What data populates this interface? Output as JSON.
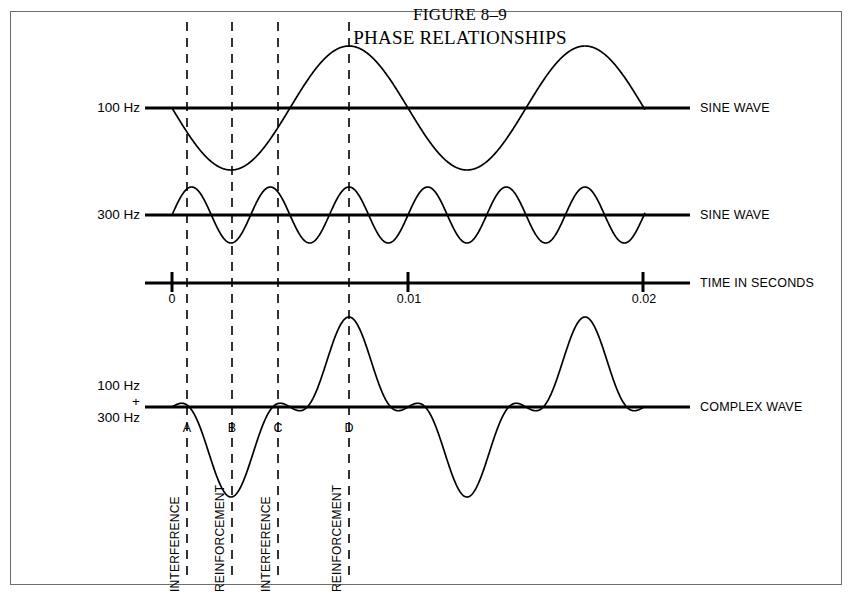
{
  "figure": {
    "title_line_1": "FIGURE 8–9",
    "title_line_2": "PHASE RELATIONSHIPS"
  },
  "row_labels": {
    "sine_100": "100 Hz",
    "sine_300": "300 Hz",
    "complex_line_1": "100 Hz",
    "complex_line_2": "+",
    "complex_line_3": "300 Hz"
  },
  "right_labels": {
    "sine_wave_100": "SINE WAVE",
    "sine_wave_300": "SINE WAVE",
    "time_axis": "TIME IN SECONDS",
    "complex_wave": "COMPLEX WAVE"
  },
  "time_axis": {
    "tick_labels": [
      "0",
      "0.01",
      "0.02"
    ],
    "unit": "seconds"
  },
  "point_markers": [
    "A",
    "B",
    "C",
    "D"
  ],
  "phase_annotations": [
    "INTERFERENCE",
    "REINFORCEMENT",
    "INTERFERENCE",
    "REINFORCEMENT"
  ],
  "colors": {
    "ink": "#000000",
    "frame": "#6d6d6d",
    "background": "#ffffff"
  },
  "chart_data": {
    "type": "line",
    "title": "PHASE RELATIONSHIPS",
    "xlabel": "TIME IN SECONDS",
    "ylabel": "",
    "x": [
      0,
      0.01,
      0.02
    ],
    "xlim": [
      0,
      0.0201
    ],
    "grid": false,
    "legend": "right",
    "series": [
      {
        "name": "100 Hz SINE WAVE",
        "frequency_hz": 100,
        "amplitude": 1.0,
        "phase_deg": 180,
        "baseline_y": 108,
        "pixel_amplitude": 62,
        "description": "Inverted sine: starts at zero descending, trough at marker B, zero crossing at marker C, crest at marker D"
      },
      {
        "name": "300 Hz SINE WAVE",
        "frequency_hz": 300,
        "amplitude": 0.45,
        "phase_deg": 0,
        "baseline_y": 215,
        "pixel_amplitude": 28,
        "description": "Positive sine: crest near marker A, trough at marker B, crest at marker C, crest at marker D"
      },
      {
        "name": "COMPLEX WAVE",
        "frequency_hz": null,
        "amplitude": 1.45,
        "phase_deg": null,
        "baseline_y": 407,
        "pixel_amplitude": 62,
        "description": "Algebraic sum of the 100 Hz and 300 Hz sine waves: small crest at A, deep trough at B, small crest at C, tall crest at D"
      }
    ],
    "annotations": [
      {
        "label": "A",
        "time_s": 0.00063,
        "effect": "INTERFERENCE"
      },
      {
        "label": "B",
        "time_s": 0.00255,
        "effect": "REINFORCEMENT"
      },
      {
        "label": "C",
        "time_s": 0.0045,
        "effect": "INTERFERENCE"
      },
      {
        "label": "D",
        "time_s": 0.00752,
        "effect": "REINFORCEMENT"
      }
    ]
  },
  "geometry": {
    "x_t0": 172,
    "x_t001": 408,
    "x_t002": 643,
    "baseline_left": 145,
    "baseline_right": 690,
    "wave_end": 645,
    "dash_x": [
      187,
      232,
      278,
      349
    ],
    "dash_top": 22,
    "dash_bottom": 580,
    "baselines": {
      "sine100": 108,
      "sine300": 215,
      "time": 283,
      "complex": 407
    }
  }
}
